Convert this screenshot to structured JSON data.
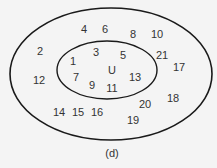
{
  "diagram": {
    "type": "venn",
    "outer_set": {
      "label": "",
      "stroke": "#1a1a1a"
    },
    "inner_set": {
      "label": "U",
      "stroke": "#1a1a1a"
    },
    "caption": "(d)",
    "inner_elements": [
      {
        "v": "1",
        "x": 73,
        "y": 61
      },
      {
        "v": "3",
        "x": 96,
        "y": 52
      },
      {
        "v": "5",
        "x": 123,
        "y": 55
      },
      {
        "v": "7",
        "x": 76,
        "y": 77
      },
      {
        "v": "9",
        "x": 92,
        "y": 85
      },
      {
        "v": "11",
        "x": 112,
        "y": 88
      },
      {
        "v": "13",
        "x": 135,
        "y": 77
      }
    ],
    "outer_elements": [
      {
        "v": "2",
        "x": 40,
        "y": 51
      },
      {
        "v": "4",
        "x": 84,
        "y": 29
      },
      {
        "v": "6",
        "x": 105,
        "y": 29
      },
      {
        "v": "8",
        "x": 133,
        "y": 34
      },
      {
        "v": "10",
        "x": 157,
        "y": 34
      },
      {
        "v": "12",
        "x": 39,
        "y": 80
      },
      {
        "v": "14",
        "x": 59,
        "y": 112
      },
      {
        "v": "15",
        "x": 78,
        "y": 112
      },
      {
        "v": "16",
        "x": 97,
        "y": 112
      },
      {
        "v": "17",
        "x": 179,
        "y": 67
      },
      {
        "v": "18",
        "x": 173,
        "y": 98
      },
      {
        "v": "19",
        "x": 133,
        "y": 120
      },
      {
        "v": "20",
        "x": 145,
        "y": 104
      },
      {
        "v": "21",
        "x": 162,
        "y": 55
      }
    ]
  }
}
